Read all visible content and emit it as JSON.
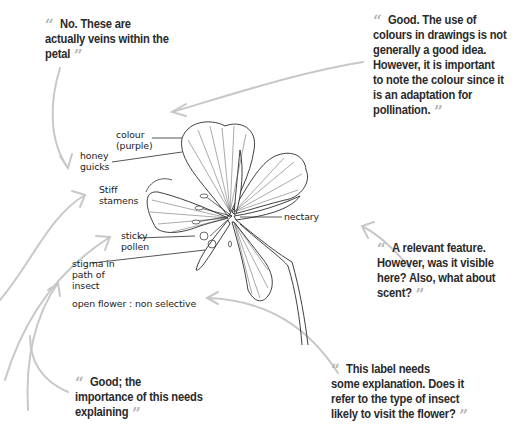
{
  "diagram": {
    "type": "annotated biological drawing",
    "labels": {
      "colour": "colour",
      "purple": "(purple)",
      "honey1": "honey",
      "honey2": "guicks",
      "stiff1": "Stiff",
      "stiff2": "stamens",
      "sticky1": "sticky",
      "sticky2": "pollen",
      "stigma1": "stigma in",
      "stigma2": "path of",
      "stigma3": "insect",
      "open_flower": "open flower : non selective",
      "nectary": "nectary"
    },
    "comments": {
      "veins": {
        "open_quote": "“",
        "text_line1": "No. These are",
        "text_line2": "actually veins within the",
        "text_line3": "petal",
        "close_quote": "”"
      },
      "colour": {
        "open_quote": "“",
        "text_line1": "Good. The use of",
        "text_line2": "colours in drawings is not",
        "text_line3": "generally a good idea.",
        "text_line4": "However, it is important",
        "text_line5": "to note the colour since it",
        "text_line6": "is an adaptation for",
        "text_line7": "pollination.",
        "close_quote": "”"
      },
      "nectary": {
        "open_quote": "“",
        "text_line1": "A relevant feature.",
        "text_line2": "However, was it visible",
        "text_line3": "here? Also, what about",
        "text_line4": "scent?",
        "close_quote": "”"
      },
      "open_flower": {
        "open_quote": "“",
        "text_line1": "This label needs",
        "text_line2": "some explanation. Does it",
        "text_line3": "refer to the type of insect",
        "text_line4": "likely to visit the flower?",
        "close_quote": "”"
      },
      "stamens": {
        "open_quote": "“",
        "text_line1": "Good; the",
        "text_line2": "importance of this needs",
        "text_line3": "explaining",
        "close_quote": "”"
      }
    },
    "colors": {
      "comment_text": "#2a2a2a",
      "quote_marks": "#b5b5b5",
      "arrows": "#c4c4c4",
      "drawing": "#222222"
    }
  }
}
